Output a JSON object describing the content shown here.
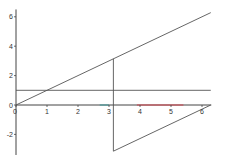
{
  "chart_data": {
    "type": "line",
    "title": "",
    "xlabel": "",
    "ylabel": "",
    "xlim": [
      0,
      6.3
    ],
    "ylim": [
      -3.4,
      6.5
    ],
    "grid": false,
    "legend": null,
    "x_ticks": [
      "0",
      "1",
      "2",
      "3",
      "4",
      "5",
      "6"
    ],
    "y_ticks": [
      "6",
      "4",
      "2",
      "0",
      "-2"
    ],
    "series": [
      {
        "name": "y = x",
        "color": "#555555",
        "x": [
          0,
          6.283
        ],
        "y": [
          0,
          6.283
        ]
      },
      {
        "name": "y = 1",
        "color": "#555555",
        "x": [
          0,
          6.283
        ],
        "y": [
          1,
          1
        ]
      },
      {
        "name": "x = pi vertical",
        "color": "#555555",
        "x": [
          3.1416,
          3.1416
        ],
        "y": [
          3.1416,
          -3.1416
        ]
      },
      {
        "name": "diagonal to 2pi",
        "color": "#555555",
        "x": [
          3.1416,
          6.283
        ],
        "y": [
          -3.1416,
          0
        ]
      },
      {
        "name": "axis highlight teal",
        "color": "#4a9a9a",
        "x": [
          2.7,
          3.0
        ],
        "y": [
          0,
          0
        ]
      },
      {
        "name": "axis highlight red",
        "color": "#d0404a",
        "x": [
          3.9,
          5.4
        ],
        "y": [
          0,
          0
        ]
      }
    ]
  },
  "axes": {
    "origin_px": {
      "x": 16,
      "y": 105
    },
    "px_per_x_unit": 31,
    "px_per_y_unit": 14.7,
    "axis_color": "#444444"
  }
}
